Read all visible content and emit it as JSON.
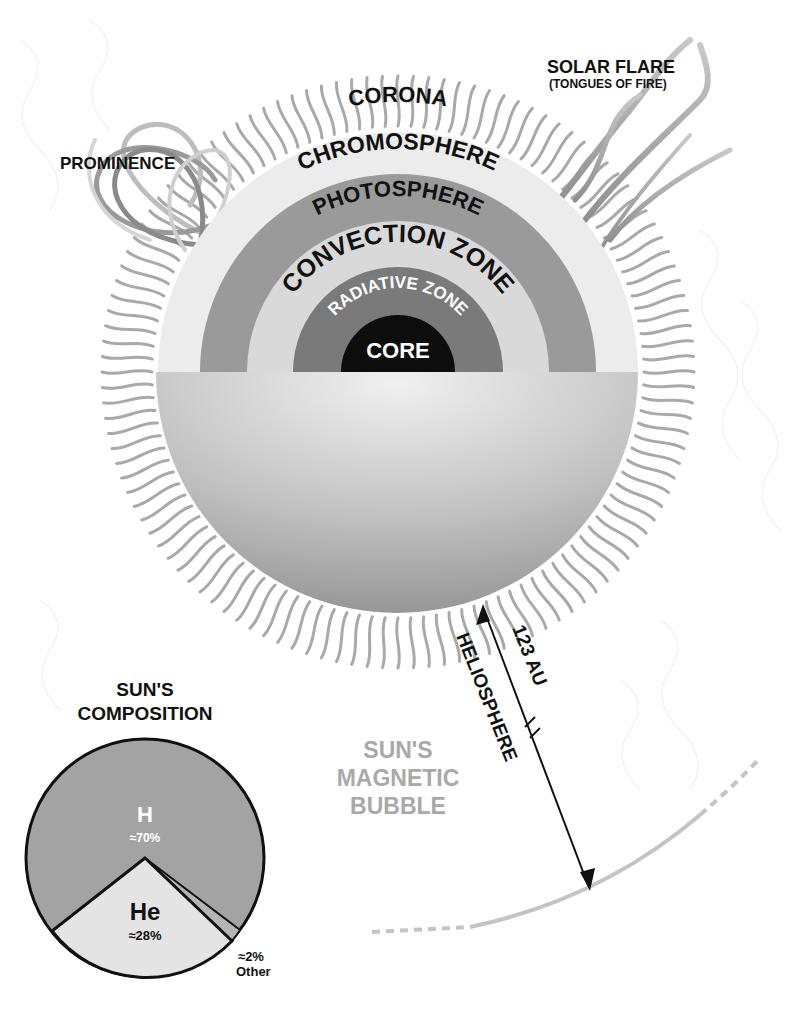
{
  "colors": {
    "background": "#ffffff",
    "ink": "#111111",
    "corona_rays": "#a8a8a8",
    "chromosphere": "#ececec",
    "photosphere": "#9a9a9a",
    "convection_zone": "#d9d9d9",
    "radiative_zone": "#7a7a7a",
    "core": "#0d0d0d",
    "hemisphere_light": "#e9e9e9",
    "hemisphere_dark": "#9b9b9b",
    "heliosphere_boundary": "#c4c4c4",
    "magnetic_bubble_text": "#a9a9a9",
    "pie_hydrogen": "#a3a3a3",
    "pie_helium": "#e4e4e4",
    "pie_other": "#b5b5b5"
  },
  "sun_layers": {
    "corona": "CORONA",
    "chromosphere": "CHROMOSPHERE",
    "photosphere": "PHOTOSPHERE",
    "convection_zone": "CONVECTION ZONE",
    "radiative_zone": "RADIATIVE ZONE",
    "core": "CORE"
  },
  "features": {
    "prominence": "PROMINENCE",
    "solar_flare": "SOLAR FLARE",
    "solar_flare_sub": "(TONGUES OF FIRE)"
  },
  "heliosphere": {
    "label": "HELIOSPHERE",
    "distance": "123 AU",
    "bubble_line1": "SUN'S",
    "bubble_line2": "MAGNETIC",
    "bubble_line3": "BUBBLE"
  },
  "composition": {
    "title_line1": "SUN'S",
    "title_line2": "COMPOSITION",
    "slices": [
      {
        "symbol": "H",
        "label": "≈70%",
        "value": 70
      },
      {
        "symbol": "He",
        "label": "≈28%",
        "value": 28
      },
      {
        "symbol": "",
        "label": "≈2%",
        "sub": "Other",
        "value": 2
      }
    ]
  },
  "chart_data": {
    "type": "pie",
    "categories": [
      "H",
      "He",
      "Other"
    ],
    "values": [
      70,
      28,
      2
    ],
    "labels": [
      "≈70%",
      "≈28%",
      "≈2% Other"
    ]
  }
}
